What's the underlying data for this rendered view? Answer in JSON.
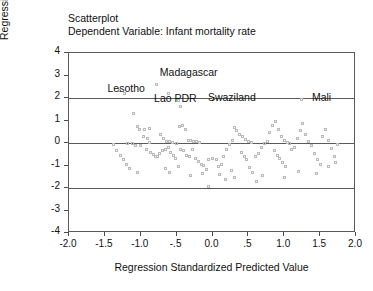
{
  "titles": {
    "line1": "Scatterplot",
    "line2": "Dependent Variable: Infant mortality rate"
  },
  "axis_titles": {
    "y": "Regression Standardized Residual",
    "x": "Regression Standardized Predicted Value"
  },
  "chart_data": {
    "type": "scatter",
    "title": "Scatterplot",
    "subtitle": "Dependent Variable: Infant mortality rate",
    "xlabel": "Regression Standardized Predicted Value",
    "ylabel": "Regression Standardized Residual",
    "xlim": [
      -2.0,
      2.0
    ],
    "ylim": [
      -4,
      4
    ],
    "xticks": [
      -2.0,
      -1.5,
      -1.0,
      -0.5,
      0.0,
      0.5,
      1.0,
      1.5,
      2.0
    ],
    "xticklabels": [
      "-2.0",
      "-1.5",
      "-1.0",
      "-.5",
      "0.0",
      ".5",
      "1.0",
      "1.5",
      "2.0"
    ],
    "yticks": [
      4,
      3,
      2,
      1,
      0,
      -1,
      -2,
      -3,
      -4
    ],
    "yticklabels": [
      "4",
      "3",
      "2",
      "1",
      "0",
      "-1",
      "-2",
      "-3",
      "-4"
    ],
    "grid": false,
    "legend": "none",
    "marker": "open-square",
    "marker_color": "#b9b9b9",
    "reference_lines": [
      {
        "axis": "y",
        "value": 2,
        "color": "#5a5a5a"
      },
      {
        "axis": "y",
        "value": 0,
        "color": "#5a5a5a"
      },
      {
        "axis": "y",
        "value": -2,
        "color": "#5a5a5a"
      }
    ],
    "annotations": [
      {
        "text": "Lesotho",
        "x": -1.45,
        "y": 2.35
      },
      {
        "text": "Madagascar",
        "x": -0.72,
        "y": 3.05
      },
      {
        "text": "Lao PDR",
        "x": -0.8,
        "y": 1.92
      },
      {
        "text": "Swaziland",
        "x": -0.05,
        "y": 1.95
      },
      {
        "text": "Mali",
        "x": 1.4,
        "y": 1.95
      }
    ],
    "points": [
      [
        -1.3,
        2.35
      ],
      [
        -1.22,
        2.22
      ],
      [
        -0.78,
        2.62
      ],
      [
        -0.62,
        2.2
      ],
      [
        -0.48,
        1.9
      ],
      [
        -0.45,
        1.62
      ],
      [
        0.02,
        1.96
      ],
      [
        1.24,
        1.92
      ],
      [
        -1.1,
        1.3
      ],
      [
        -1.05,
        0.72
      ],
      [
        -1.02,
        0.58
      ],
      [
        -0.96,
        0.3
      ],
      [
        -0.9,
        0.18
      ],
      [
        -0.88,
        0.02
      ],
      [
        -1.18,
        0.0
      ],
      [
        -1.12,
        -0.02
      ],
      [
        -1.08,
        -0.1
      ],
      [
        -1.0,
        -0.12
      ],
      [
        -0.92,
        -0.28
      ],
      [
        -0.86,
        -0.42
      ],
      [
        -0.82,
        -0.52
      ],
      [
        -0.8,
        -0.58
      ],
      [
        -0.76,
        -0.62
      ],
      [
        -0.74,
        -0.48
      ],
      [
        -0.7,
        -0.35
      ],
      [
        -0.66,
        -0.3
      ],
      [
        -0.62,
        -0.22
      ],
      [
        -0.58,
        -0.4
      ],
      [
        -0.55,
        -0.55
      ],
      [
        -0.52,
        -0.68
      ],
      [
        -0.95,
        0.62
      ],
      [
        -0.88,
        0.66
      ],
      [
        -0.72,
        0.4
      ],
      [
        -0.68,
        0.2
      ],
      [
        -0.64,
        0.08
      ],
      [
        -0.6,
        0.05
      ],
      [
        -0.56,
        0.02
      ],
      [
        -0.5,
        0.0
      ],
      [
        -0.46,
        0.72
      ],
      [
        -0.42,
        0.78
      ],
      [
        -0.38,
        0.6
      ],
      [
        -0.34,
        0.12
      ],
      [
        -0.3,
        0.1
      ],
      [
        -0.26,
        0.08
      ],
      [
        -0.22,
        0.06
      ],
      [
        -0.18,
        0.04
      ],
      [
        -0.44,
        -0.3
      ],
      [
        -0.4,
        -0.35
      ],
      [
        -0.36,
        -0.55
      ],
      [
        -0.32,
        -0.62
      ],
      [
        -0.28,
        -0.3
      ],
      [
        -0.24,
        -0.7
      ],
      [
        -0.2,
        -0.8
      ],
      [
        -0.16,
        -0.95
      ],
      [
        -0.12,
        -1.0
      ],
      [
        -0.08,
        -1.18
      ],
      [
        -0.05,
        -0.75
      ],
      [
        0.0,
        -0.68
      ],
      [
        0.05,
        -0.72
      ],
      [
        0.08,
        -1.05
      ],
      [
        0.12,
        -0.95
      ],
      [
        0.16,
        -0.6
      ],
      [
        0.2,
        -0.3
      ],
      [
        0.24,
        -0.05
      ],
      [
        0.28,
        0.1
      ],
      [
        0.3,
        0.68
      ],
      [
        0.34,
        0.55
      ],
      [
        0.38,
        0.4
      ],
      [
        0.42,
        0.3
      ],
      [
        0.46,
        0.14
      ],
      [
        0.5,
        0.05
      ],
      [
        0.54,
        0.02
      ],
      [
        0.4,
        -0.4
      ],
      [
        0.44,
        -0.58
      ],
      [
        0.48,
        -0.75
      ],
      [
        0.52,
        -1.1
      ],
      [
        0.56,
        -1.3
      ],
      [
        0.6,
        -0.62
      ],
      [
        0.64,
        -0.45
      ],
      [
        0.68,
        -0.2
      ],
      [
        0.72,
        0.0
      ],
      [
        0.76,
        0.06
      ],
      [
        0.8,
        0.48
      ],
      [
        0.84,
        0.8
      ],
      [
        0.88,
        0.95
      ],
      [
        0.92,
        0.6
      ],
      [
        0.96,
        0.28
      ],
      [
        1.0,
        0.12
      ],
      [
        1.04,
        0.02
      ],
      [
        1.08,
        -0.02
      ],
      [
        0.86,
        -0.35
      ],
      [
        0.9,
        -0.55
      ],
      [
        0.94,
        -0.7
      ],
      [
        0.98,
        -0.85
      ],
      [
        1.02,
        -1.05
      ],
      [
        1.1,
        -0.3
      ],
      [
        1.14,
        -0.18
      ],
      [
        1.18,
        0.22
      ],
      [
        1.22,
        0.55
      ],
      [
        1.26,
        0.85
      ],
      [
        1.3,
        0.4
      ],
      [
        1.34,
        0.05
      ],
      [
        1.38,
        -0.1
      ],
      [
        1.42,
        -0.45
      ],
      [
        1.46,
        -0.72
      ],
      [
        1.5,
        -0.95
      ],
      [
        1.54,
        0.3
      ],
      [
        1.58,
        0.62
      ],
      [
        1.62,
        0.1
      ],
      [
        1.66,
        -0.25
      ],
      [
        1.7,
        -0.6
      ],
      [
        1.74,
        -0.05
      ],
      [
        -1.38,
        -0.05
      ],
      [
        -1.34,
        -0.35
      ],
      [
        -1.28,
        -0.55
      ],
      [
        -1.24,
        -0.72
      ],
      [
        -1.2,
        -0.95
      ],
      [
        -1.16,
        -1.15
      ],
      [
        -0.05,
        -1.95
      ],
      [
        0.3,
        -1.55
      ],
      [
        0.1,
        -1.4
      ],
      [
        -0.3,
        -1.45
      ],
      [
        -0.6,
        -1.3
      ],
      [
        0.7,
        -1.45
      ],
      [
        1.0,
        -1.55
      ],
      [
        1.2,
        -1.25
      ],
      [
        1.45,
        -1.35
      ],
      [
        -1.05,
        -1.3
      ],
      [
        0.18,
        -1.62
      ],
      [
        0.62,
        -1.7
      ],
      [
        -0.48,
        -1.05
      ],
      [
        -0.66,
        -1.12
      ],
      [
        1.62,
        -1.05
      ],
      [
        1.72,
        -0.85
      ],
      [
        0.26,
        -1.2
      ],
      [
        -0.14,
        -1.35
      ]
    ]
  }
}
